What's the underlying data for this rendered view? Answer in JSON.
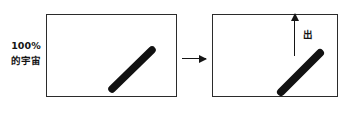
{
  "diagram": {
    "source_label": {
      "line1": "100%",
      "line2": "的宇宙"
    },
    "panels": [
      {
        "id": "left-panel",
        "name": "entry-panel",
        "arrow_caption_top": "光子",
        "arrow_caption_bottom": "入",
        "slab": "diagonal-slab"
      },
      {
        "id": "right-panel",
        "name": "exit-panel",
        "arrow_caption": "出",
        "slab": "diagonal-slab"
      }
    ],
    "arrows": {
      "incoming": "arrow-right",
      "transition": "arrow-right",
      "outgoing": "arrow-up"
    },
    "colors": {
      "ink": "#151515",
      "border": "#2b2b2b",
      "background": "#ffffff"
    }
  }
}
